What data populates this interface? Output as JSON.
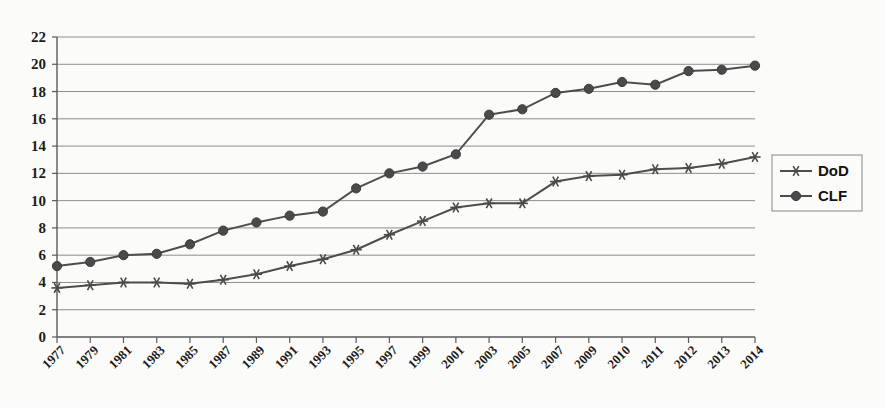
{
  "chart_data": {
    "type": "line",
    "title": "",
    "subtitle": "",
    "xlabel": "",
    "ylabel": "",
    "ylim": [
      0,
      22
    ],
    "ytick_step": 2,
    "yticks": [
      0,
      2,
      4,
      6,
      8,
      10,
      12,
      14,
      16,
      18,
      20,
      22
    ],
    "grid": true,
    "legend_position": "right",
    "categories": [
      "1977",
      "1979",
      "1981",
      "1983",
      "1985",
      "1987",
      "1989",
      "1991",
      "1993",
      "1995",
      "1997",
      "1999",
      "2001",
      "2003",
      "2005",
      "2007",
      "2009",
      "2010",
      "2011",
      "2012",
      "2013",
      "2014"
    ],
    "series": [
      {
        "name": "DoD",
        "marker": "asterisk",
        "color": "#4d4d4d",
        "values": [
          3.6,
          3.8,
          4.0,
          4.0,
          3.9,
          4.2,
          4.6,
          5.2,
          5.7,
          6.4,
          7.5,
          8.5,
          9.5,
          9.8,
          9.8,
          11.4,
          11.8,
          11.9,
          12.3,
          12.4,
          12.7,
          13.2
        ]
      },
      {
        "name": "CLF",
        "marker": "circle",
        "color": "#4a4a4a",
        "values": [
          5.2,
          5.5,
          6.0,
          6.1,
          6.8,
          7.8,
          8.4,
          8.9,
          9.2,
          10.9,
          12.0,
          12.5,
          13.4,
          16.3,
          16.7,
          17.9,
          18.2,
          18.7,
          18.5,
          19.5,
          19.6,
          19.9
        ]
      }
    ]
  },
  "legend": {
    "items": [
      {
        "label": "DoD",
        "marker": "asterisk"
      },
      {
        "label": "CLF",
        "marker": "circle"
      }
    ]
  },
  "colors": {
    "background": "#fbfbf9",
    "grid": "#8e8e8e",
    "axis": "#5a5a5a",
    "series_dod": "#4d4d4d",
    "series_clf": "#4a4a4a",
    "text": "#1c1c1c"
  }
}
